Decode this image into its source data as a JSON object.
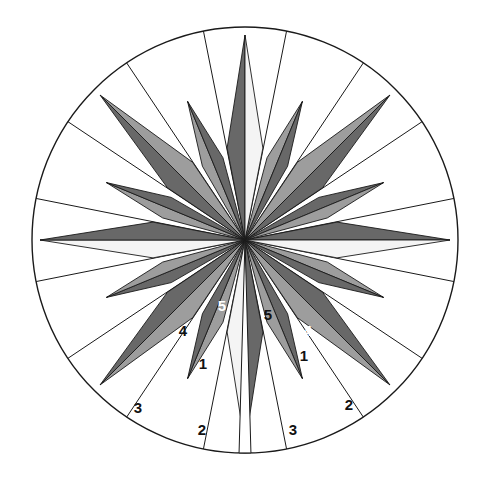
{
  "figure": {
    "kind": "compass-rose",
    "background_color": "#ffffff",
    "outline_color": "#1a1a1a",
    "outline_width": 1.4
  },
  "geometry": {
    "center_x": 245,
    "center_y": 240,
    "outer_radius": 213,
    "major_point_radius": 205,
    "minor_point_radius": 150,
    "major_half_width_deg": 11,
    "minor_half_width_deg": 7.5,
    "sector_count": 16,
    "gap_deg": 1.6
  },
  "colors": {
    "dark": "#686868",
    "mid": "#9d9d9d",
    "light": "#f4f4f4",
    "white": "#ffffff",
    "stroke": "#1a1a1a",
    "label_dark": "#111111",
    "label_light": "#ffffff"
  },
  "points": [
    {
      "name": "north",
      "angle": 0,
      "size": "major",
      "left_fill": "dark",
      "right_fill": "light"
    },
    {
      "name": "nnw-minor",
      "angle": 337.5,
      "size": "minor",
      "left_fill": "mid",
      "right_fill": "dark"
    },
    {
      "name": "northwest",
      "angle": 315,
      "size": "major",
      "left_fill": "dark",
      "right_fill": "mid"
    },
    {
      "name": "wnw-minor",
      "angle": 292.5,
      "size": "minor",
      "left_fill": "mid",
      "right_fill": "dark"
    },
    {
      "name": "west",
      "angle": 270,
      "size": "major",
      "left_fill": "light",
      "right_fill": "dark"
    },
    {
      "name": "wsw-minor",
      "angle": 247.5,
      "size": "minor",
      "left_fill": "dark",
      "right_fill": "mid"
    },
    {
      "name": "southwest",
      "angle": 225,
      "size": "major",
      "left_fill": "mid",
      "right_fill": "dark"
    },
    {
      "name": "ssw-minor",
      "angle": 202.5,
      "size": "minor",
      "left_fill": "mid",
      "right_fill": "dark"
    },
    {
      "name": "south",
      "angle": 180,
      "size": "major",
      "left_fill": "dark",
      "right_fill": "light"
    },
    {
      "name": "sse-minor",
      "angle": 157.5,
      "size": "minor",
      "left_fill": "dark",
      "right_fill": "mid"
    },
    {
      "name": "southeast",
      "angle": 135,
      "size": "major",
      "left_fill": "dark",
      "right_fill": "mid"
    },
    {
      "name": "ese-minor",
      "angle": 112.5,
      "size": "minor",
      "left_fill": "mid",
      "right_fill": "dark"
    },
    {
      "name": "east",
      "angle": 90,
      "size": "major",
      "left_fill": "dark",
      "right_fill": "light"
    },
    {
      "name": "ene-minor",
      "angle": 67.5,
      "size": "minor",
      "left_fill": "dark",
      "right_fill": "mid"
    },
    {
      "name": "northeast",
      "angle": 45,
      "size": "major",
      "left_fill": "mid",
      "right_fill": "dark"
    },
    {
      "name": "nne-minor",
      "angle": 22.5,
      "size": "minor",
      "left_fill": "mid",
      "right_fill": "dark"
    }
  ],
  "labels": [
    {
      "id": "left-5",
      "text": "5",
      "x": 222,
      "y": 305,
      "color": "label_light"
    },
    {
      "id": "left-4",
      "text": "4",
      "x": 183,
      "y": 330,
      "color": "label_dark"
    },
    {
      "id": "left-1",
      "text": "1",
      "x": 203,
      "y": 363,
      "color": "label_dark"
    },
    {
      "id": "left-2",
      "text": "2",
      "x": 202,
      "y": 429,
      "color": "label_dark"
    },
    {
      "id": "left-3",
      "text": "3",
      "x": 138,
      "y": 407,
      "color": "label_dark"
    },
    {
      "id": "right-5",
      "text": "5",
      "x": 268,
      "y": 314,
      "color": "label_dark"
    },
    {
      "id": "right-4",
      "text": "4",
      "x": 308,
      "y": 330,
      "color": "label_light"
    },
    {
      "id": "right-1",
      "text": "1",
      "x": 304,
      "y": 355,
      "color": "label_dark"
    },
    {
      "id": "right-3",
      "text": "3",
      "x": 293,
      "y": 429,
      "color": "label_dark"
    },
    {
      "id": "right-2",
      "text": "2",
      "x": 349,
      "y": 404,
      "color": "label_dark"
    }
  ]
}
